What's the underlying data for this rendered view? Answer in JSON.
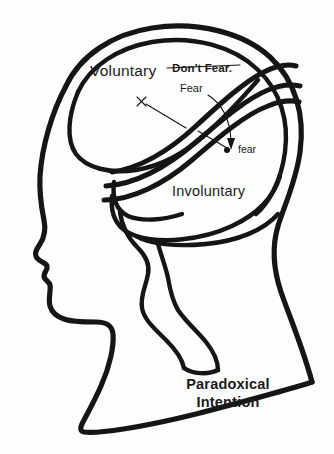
{
  "figure": {
    "background_color": "#fdfdfd",
    "ink_color": "#151515"
  },
  "labels": {
    "voluntary": "Voluntary",
    "involuntary": "Involuntary",
    "dont_fear": "Don't Fear.",
    "dont_fear_struck": true,
    "fear_capital": "Fear",
    "fear_lowercase": "fear",
    "cross_mark": "✗"
  },
  "caption": {
    "line1": "Paradoxical",
    "line2": "Intention"
  },
  "annotations": {
    "marker_dot_name": "fear-point-dot",
    "arrow_from_fear_to_fear_point": true,
    "leader_from_cross_to_band": true
  }
}
